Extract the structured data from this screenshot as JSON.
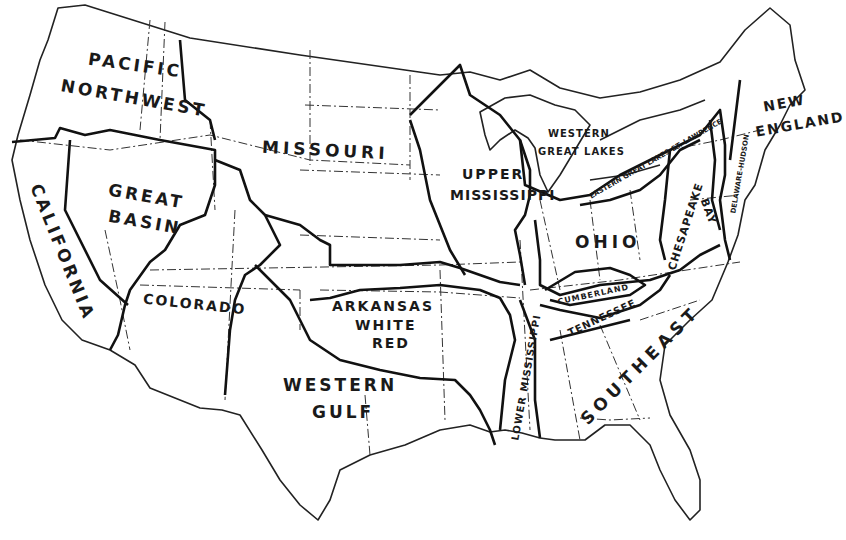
{
  "map": {
    "subject": "Water Resource Regions of the Conterminous United States",
    "colors": {
      "background": "#ffffff",
      "ink": "#111111"
    },
    "legend_styles": {
      "region_boundary": "heavy solid line",
      "state_boundary": "dash-dot line"
    },
    "regions": [
      {
        "id": "pacific-northwest",
        "line1": "PACIFIC",
        "line2": "NORTHWEST"
      },
      {
        "id": "california",
        "line1": "CALIFORNIA"
      },
      {
        "id": "great-basin",
        "line1": "GREAT",
        "line2": "BASIN"
      },
      {
        "id": "colorado",
        "line1": "COLORADO"
      },
      {
        "id": "missouri",
        "line1": "MISSOURI"
      },
      {
        "id": "arkansas-white-red",
        "line1": "ARKANSAS",
        "line2": "WHITE",
        "line3": "RED"
      },
      {
        "id": "western-gulf",
        "line1": "WESTERN",
        "line2": "GULF"
      },
      {
        "id": "upper-mississippi",
        "line1": "UPPER",
        "line2": "MISSISSIPPI"
      },
      {
        "id": "lower-mississippi",
        "line1": "LOWER MISSISSIPPI"
      },
      {
        "id": "western-great-lakes",
        "line1": "WESTERN",
        "line2": "GREAT LAKES"
      },
      {
        "id": "eastern-great-lakes",
        "line1": "EASTERN GREAT LAKES-ST. LAWRENCE"
      },
      {
        "id": "ohio",
        "line1": "OHIO"
      },
      {
        "id": "cumberland",
        "line1": "CUMBERLAND"
      },
      {
        "id": "tennessee",
        "line1": "TENNESSEE"
      },
      {
        "id": "southeast",
        "line1": "SOUTHEAST"
      },
      {
        "id": "chesapeake-bay",
        "line1": "CHESAPEAKE",
        "line2": "BAY"
      },
      {
        "id": "delaware-hudson",
        "line1": "DELAWARE-HUDSON"
      },
      {
        "id": "new-england",
        "line1": "NEW",
        "line2": "ENGLAND"
      }
    ]
  }
}
